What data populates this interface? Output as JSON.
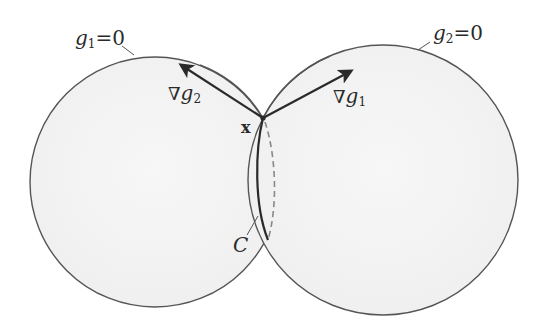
{
  "diagram": {
    "type": "two intersecting spheres with gradient vectors",
    "surfaces": [
      {
        "id": "g1",
        "label_var": "g",
        "label_sub": "1",
        "label_rest": "=0",
        "center": [
          155,
          182
        ],
        "radius": 125
      },
      {
        "id": "g2",
        "label_var": "g",
        "label_sub": "2",
        "label_rest": "=0",
        "center": [
          383,
          180
        ],
        "radius": 135
      }
    ],
    "point": {
      "label": "x",
      "at": [
        263,
        118
      ]
    },
    "vectors": [
      {
        "id": "grad-g2",
        "nabla": "∇",
        "var": "g",
        "sub": "2",
        "from": [
          263,
          118
        ],
        "to": [
          180,
          64
        ]
      },
      {
        "id": "grad-g1",
        "nabla": "∇",
        "var": "g",
        "sub": "1",
        "from": [
          263,
          118
        ],
        "to": [
          352,
          70
        ]
      }
    ],
    "curve": {
      "label": "C"
    },
    "colors": {
      "outline": "#555555",
      "fill": "#f3f3f3",
      "arrow": "#2a2a2a",
      "text": "#2a2a2a"
    }
  }
}
